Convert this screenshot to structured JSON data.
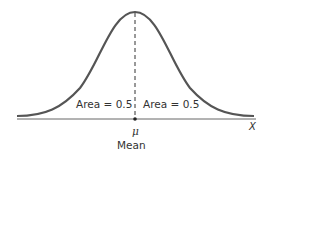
{
  "diagram": {
    "left_area_label": "Area = 0.5",
    "right_area_label": "Area = 0.5",
    "mean_symbol": "μ",
    "mean_label": "Mean",
    "axis_label": "X",
    "colors": {
      "curve": "#555555",
      "axis": "#555555",
      "text": "#333333",
      "background": "#ffffff"
    }
  }
}
